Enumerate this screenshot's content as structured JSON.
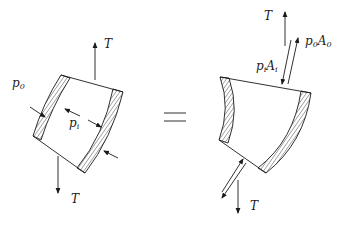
{
  "diagram": {
    "type": "free-body diagram of curved pipe segment",
    "left_figure": {
      "labels": {
        "tension_top": "T",
        "tension_bottom": "T",
        "outer_pressure": "p",
        "outer_pressure_sub": "0",
        "inner_pressure": "p",
        "inner_pressure_sub": "i"
      }
    },
    "equals_sign": "=",
    "right_figure": {
      "labels": {
        "tension_top": "T",
        "tension_bottom": "T",
        "outer_force_p": "p",
        "outer_force_p_sub": "0",
        "outer_force_A": "A",
        "outer_force_A_sub": "0",
        "inner_force_p": "p",
        "inner_force_p_sub": "i",
        "inner_force_A": "A",
        "inner_force_A_sub": "i"
      }
    },
    "colors": {
      "line": "#1a1a1a",
      "background": "#ffffff"
    }
  }
}
